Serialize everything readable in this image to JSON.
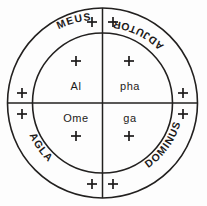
{
  "diagram": {
    "background_color": "#fdfdfd",
    "line_color": "#22201f",
    "text_color": "#1d1b1a",
    "outer_ring": {
      "name": "outer-ring",
      "words": [
        {
          "id": "meus",
          "label": "MEUS",
          "position": "top-left",
          "orientation": "inverted"
        },
        {
          "id": "adjutor",
          "label": "ADJUTOR",
          "position": "top-right",
          "orientation": "inverted"
        },
        {
          "id": "dominus",
          "label": "DOMINUS",
          "position": "bottom-right",
          "orientation": "upright"
        },
        {
          "id": "agla",
          "label": "AGLA",
          "position": "bottom-left",
          "orientation": "upright"
        }
      ],
      "cross_count": 8
    },
    "inner_circle": {
      "name": "inner-circle",
      "quadrants": [
        {
          "id": "q-top-left",
          "label": "Al",
          "position": "top-left"
        },
        {
          "id": "q-top-right",
          "label": "pha",
          "position": "top-right"
        },
        {
          "id": "q-bottom-left",
          "label": "Ome",
          "position": "bottom-left"
        },
        {
          "id": "q-bottom-right",
          "label": "ga",
          "position": "bottom-right"
        }
      ],
      "cross_count": 4
    },
    "crosses": {
      "glyph": "+",
      "outer_ring_positions": [
        "top-left-of-vertical",
        "top-right-of-vertical",
        "right-above-horizontal",
        "right-below-horizontal",
        "bottom-right-of-vertical",
        "bottom-left-of-vertical",
        "left-below-horizontal",
        "left-above-horizontal"
      ],
      "inner_circle_positions": [
        "above-al",
        "above-pha",
        "below-ome",
        "below-ga"
      ]
    },
    "geometry": {
      "center_x": 102.5,
      "center_y": 103,
      "outer_radius": 95,
      "inner_radius": 70,
      "ring_text_radius": 82.5
    }
  }
}
